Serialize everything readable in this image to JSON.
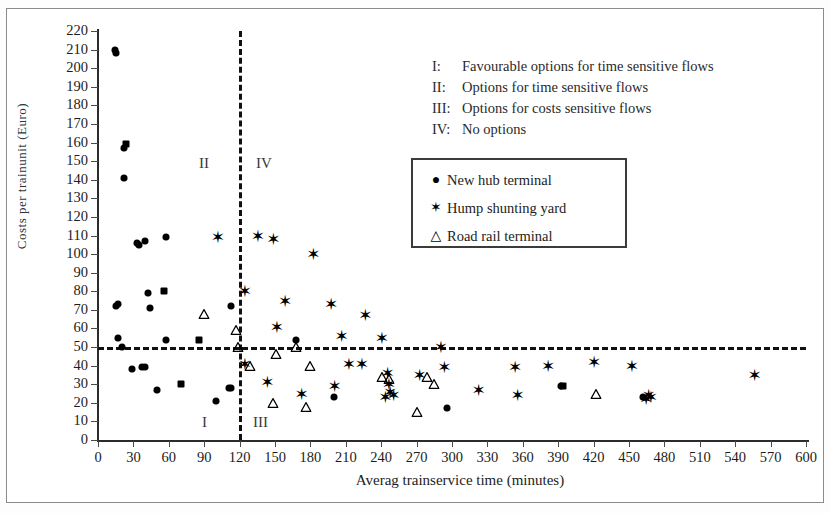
{
  "figure": {
    "x_axis_title": "Averag  trainservice time (minutes)",
    "y_axis_title": "Costs per trainunit (Euro)"
  },
  "notes": [
    {
      "key": "I:",
      "text": "Favourable options for time sensitive flows"
    },
    {
      "key": "II:",
      "text": "Options for time sensitive flows"
    },
    {
      "key": "III:",
      "text": "Options for costs sensitive flows"
    },
    {
      "key": "IV:",
      "text": "No options"
    }
  ],
  "legend": {
    "entries": [
      {
        "symbol": "●",
        "icon": "filled-circle-marker",
        "label": "New hub terminal"
      },
      {
        "symbol": "✶",
        "icon": "asterisk-marker",
        "label": "Hump shunting yard"
      },
      {
        "symbol": "△",
        "icon": "open-triangle-marker",
        "label": "Road rail terminal"
      }
    ]
  },
  "quadrants": [
    {
      "name": "II",
      "x": 199,
      "y": 155
    },
    {
      "name": "IV",
      "x": 256,
      "y": 155
    },
    {
      "name": "I",
      "x": 202,
      "y": 414
    },
    {
      "name": "III",
      "x": 253,
      "y": 414
    }
  ],
  "chart_data": {
    "type": "scatter",
    "title": "",
    "xlabel": "Averag  trainservice time (minutes)",
    "ylabel": "Costs per trainunit (Euro)",
    "xlim": [
      0,
      600
    ],
    "ylim": [
      0,
      220
    ],
    "xticks": [
      0,
      30,
      60,
      90,
      120,
      150,
      180,
      210,
      240,
      270,
      300,
      330,
      360,
      390,
      420,
      450,
      480,
      510,
      540,
      570,
      600
    ],
    "yticks": [
      0,
      10,
      20,
      30,
      40,
      50,
      60,
      70,
      80,
      90,
      100,
      110,
      120,
      130,
      140,
      150,
      160,
      170,
      180,
      190,
      200,
      210,
      220
    ],
    "grid": false,
    "legend_position": "upper-right",
    "reference_lines": [
      {
        "axis": "x",
        "value": 120,
        "style": "dashed"
      },
      {
        "axis": "y",
        "value": 50,
        "style": "dashed"
      }
    ],
    "quadrant_annotations": [
      "I",
      "II",
      "III",
      "IV"
    ],
    "series": [
      {
        "name": "New hub terminal",
        "marker": "filled-circle",
        "points": [
          [
            14,
            210
          ],
          [
            15,
            208
          ],
          [
            22,
            157
          ],
          [
            24,
            159
          ],
          [
            22,
            141
          ],
          [
            33,
            106
          ],
          [
            35,
            105
          ],
          [
            40,
            107
          ],
          [
            58,
            109
          ],
          [
            42,
            79
          ],
          [
            56,
            80
          ],
          [
            15,
            72
          ],
          [
            17,
            73
          ],
          [
            44,
            71
          ],
          [
            113,
            72
          ],
          [
            17,
            55
          ],
          [
            58,
            54
          ],
          [
            86,
            54
          ],
          [
            20,
            50
          ],
          [
            168,
            54
          ],
          [
            29,
            38
          ],
          [
            37,
            39
          ],
          [
            40,
            39
          ],
          [
            50,
            27
          ],
          [
            70,
            30
          ],
          [
            111,
            28
          ],
          [
            113,
            28
          ],
          [
            100,
            21
          ],
          [
            200,
            23
          ],
          [
            296,
            17
          ],
          [
            392,
            29
          ],
          [
            394,
            29
          ],
          [
            462,
            23
          ]
        ]
      },
      {
        "name": "Hump shunting yard",
        "marker": "asterisk",
        "points": [
          [
            101,
            109
          ],
          [
            135,
            110
          ],
          [
            148,
            108
          ],
          [
            182,
            100
          ],
          [
            124,
            80
          ],
          [
            158,
            75
          ],
          [
            197,
            73
          ],
          [
            226,
            67
          ],
          [
            151,
            61
          ],
          [
            206,
            56
          ],
          [
            240,
            55
          ],
          [
            290,
            50
          ],
          [
            124,
            41
          ],
          [
            212,
            41
          ],
          [
            223,
            41
          ],
          [
            293,
            39
          ],
          [
            353,
            39
          ],
          [
            381,
            40
          ],
          [
            420,
            42
          ],
          [
            452,
            40
          ],
          [
            245,
            36
          ],
          [
            272,
            35
          ],
          [
            143,
            31
          ],
          [
            200,
            29
          ],
          [
            246,
            30
          ],
          [
            172,
            25
          ],
          [
            243,
            23
          ],
          [
            250,
            24
          ],
          [
            247,
            26
          ],
          [
            322,
            27
          ],
          [
            355,
            24
          ],
          [
            466,
            24
          ],
          [
            468,
            23
          ],
          [
            464,
            22
          ],
          [
            556,
            35
          ]
        ]
      },
      {
        "name": "Road rail terminal",
        "marker": "open-triangle",
        "points": [
          [
            90,
            68
          ],
          [
            117,
            59
          ],
          [
            119,
            50
          ],
          [
            168,
            50
          ],
          [
            151,
            46
          ],
          [
            129,
            40
          ],
          [
            180,
            40
          ],
          [
            241,
            34
          ],
          [
            247,
            33
          ],
          [
            279,
            34
          ],
          [
            285,
            30
          ],
          [
            148,
            20
          ],
          [
            176,
            18
          ],
          [
            270,
            15
          ],
          [
            422,
            25
          ]
        ]
      }
    ]
  }
}
